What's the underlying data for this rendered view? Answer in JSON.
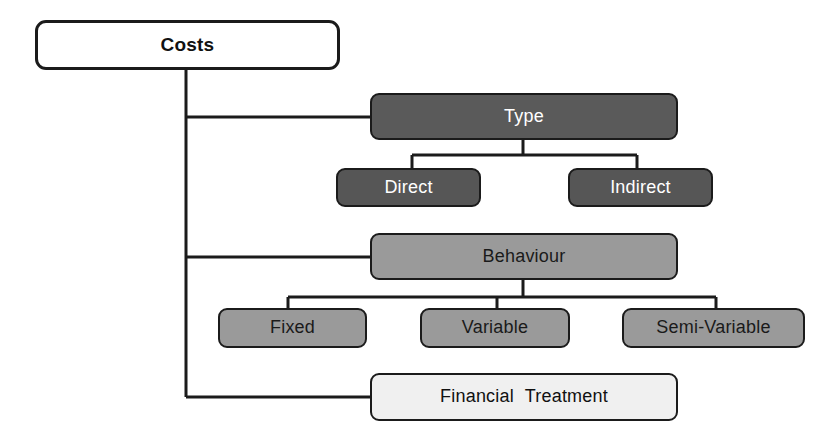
{
  "diagram": {
    "type": "hierarchy-tree",
    "title": "Costs",
    "canvas": {
      "width": 837,
      "height": 445,
      "background": "#ffffff"
    },
    "colors": {
      "outline": "#1b1b1b",
      "root_fill": "#ffffff",
      "type_fill": "#5a5a5a",
      "type_child_fill": "#565656",
      "behaviour_fill": "#9a9a9a",
      "behaviour_child_fill": "#9a9a9a",
      "financial_fill": "#f0f0f0",
      "dark_text": "#111111",
      "light_text": "#ffffff"
    },
    "root": {
      "label": "Costs",
      "fill": "#ffffff",
      "text_color": "#111111",
      "box": {
        "x": 35,
        "y": 20,
        "w": 305,
        "h": 50
      }
    },
    "branches": [
      {
        "id": "type",
        "label": "Type",
        "fill": "#5a5a5a",
        "text_color": "#ffffff",
        "box": {
          "x": 370,
          "y": 93,
          "w": 308,
          "h": 47
        },
        "children": [
          {
            "id": "direct",
            "label": "Direct",
            "fill": "#565656",
            "text_color": "#ffffff",
            "box": {
              "x": 336,
              "y": 168,
              "w": 145,
              "h": 39
            }
          },
          {
            "id": "indirect",
            "label": "Indirect",
            "fill": "#565656",
            "text_color": "#ffffff",
            "box": {
              "x": 568,
              "y": 168,
              "w": 145,
              "h": 39
            }
          }
        ]
      },
      {
        "id": "behaviour",
        "label": "Behaviour",
        "fill": "#9a9a9a",
        "text_color": "#1a1a1a",
        "box": {
          "x": 370,
          "y": 233,
          "w": 308,
          "h": 47
        },
        "children": [
          {
            "id": "fixed",
            "label": "Fixed",
            "fill": "#9a9a9a",
            "text_color": "#1a1a1a",
            "box": {
              "x": 218,
              "y": 308,
              "w": 149,
              "h": 40
            }
          },
          {
            "id": "variable",
            "label": "Variable",
            "fill": "#9a9a9a",
            "text_color": "#1a1a1a",
            "box": {
              "x": 420,
              "y": 308,
              "w": 150,
              "h": 40
            }
          },
          {
            "id": "semi-variable",
            "label": "Semi-Variable",
            "fill": "#9a9a9a",
            "text_color": "#1a1a1a",
            "box": {
              "x": 622,
              "y": 308,
              "w": 183,
              "h": 40
            }
          }
        ]
      },
      {
        "id": "financial-treatment",
        "label": "Financial  Treatment",
        "fill": "#f0f0f0",
        "text_color": "#111111",
        "box": {
          "x": 370,
          "y": 373,
          "w": 308,
          "h": 48
        },
        "children": []
      }
    ]
  }
}
